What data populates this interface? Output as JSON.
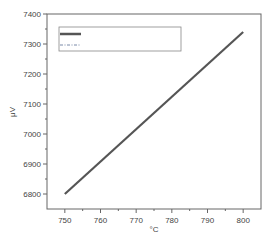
{
  "chart_data": {
    "type": "line",
    "title": "",
    "xlabel": "°C",
    "ylabel": "μV",
    "xlim": [
      745,
      805
    ],
    "ylim": [
      6750,
      7400
    ],
    "xticks": [
      750,
      760,
      770,
      780,
      790,
      800
    ],
    "yticks": [
      6800,
      6900,
      7000,
      7100,
      7200,
      7300,
      7400
    ],
    "grid": false,
    "legend_position": "upper left",
    "series": [
      {
        "name": "",
        "style": "solid",
        "color": "#555555",
        "x": [
          750,
          800
        ],
        "y": [
          6800,
          7340
        ]
      },
      {
        "name": "",
        "style": "dash-dot",
        "color": "#7a8aa8",
        "x": [],
        "y": []
      }
    ]
  },
  "labels": {
    "xlabel": "°C",
    "ylabel": "μV",
    "xticks": [
      "750",
      "760",
      "770",
      "780",
      "790",
      "800"
    ],
    "yticks": [
      "6800",
      "6900",
      "7000",
      "7100",
      "7200",
      "7300",
      "7400"
    ]
  },
  "colors": {
    "frame": "#666666",
    "line": "#555555",
    "legend_border": "#888888"
  }
}
